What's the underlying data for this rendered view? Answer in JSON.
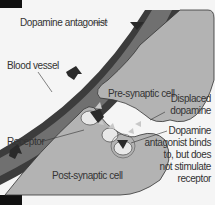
{
  "diagram": {
    "labels": {
      "dopamine_antagonist": "Dopamine antagonist",
      "blood_vessel": "Blood vessel",
      "pre_synaptic_cell": "Pre-synaptic cell",
      "displaced_dopamine_1": "Displaced",
      "displaced_dopamine_2": "dopamine",
      "receptor": "Receptor",
      "post_synaptic_cell": "Post-synaptic cell",
      "binds_1": "Dopamine",
      "binds_2": "antagonist binds",
      "binds_3": "to, but does",
      "binds_4": "not stimulate",
      "binds_5": "receptor"
    },
    "colors": {
      "background": "#f5f5f5",
      "vessel_dark": "#4a4a4a",
      "vessel_inner": "#6b6b6b",
      "cell_fill": "#b3b3b3",
      "receptor": "#e8e8e8",
      "antagonist": "#2a2a2a",
      "dopamine": "#c8c8c8",
      "corner": "#111111"
    }
  }
}
